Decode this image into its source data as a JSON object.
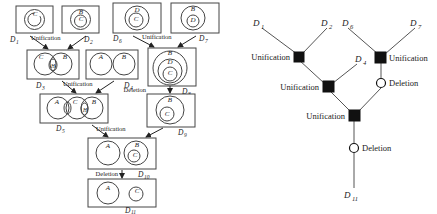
{
  "figure": {
    "left_panel": {
      "name": "venn-derivation-panel",
      "diagrams": [
        {
          "id": "D1",
          "label": "D",
          "sub": "1",
          "sets": [
            "C"
          ]
        },
        {
          "id": "D2",
          "label": "D",
          "sub": "2",
          "sets": [
            "B",
            "C"
          ]
        },
        {
          "id": "D3",
          "label": "D",
          "sub": "3",
          "sets": [
            "C",
            "B",
            "H"
          ]
        },
        {
          "id": "D4",
          "label": "D",
          "sub": "4",
          "sets": [
            "A",
            "B"
          ]
        },
        {
          "id": "D5",
          "label": "D",
          "sub": "5",
          "sets": [
            "A",
            "C",
            "B",
            "H"
          ]
        },
        {
          "id": "D6",
          "label": "D",
          "sub": "6",
          "sets": [
            "D",
            "C"
          ]
        },
        {
          "id": "D7",
          "label": "D",
          "sub": "7",
          "sets": [
            "B",
            "D"
          ]
        },
        {
          "id": "D8",
          "label": "D",
          "sub": "8",
          "sets": [
            "B",
            "D",
            "C"
          ]
        },
        {
          "id": "D9",
          "label": "D",
          "sub": "9",
          "sets": [
            "B",
            "C"
          ]
        },
        {
          "id": "D10",
          "label": "D",
          "sub": "10",
          "sets": [
            "A",
            "B",
            "C"
          ]
        },
        {
          "id": "D11",
          "label": "D",
          "sub": "11",
          "sets": [
            "A",
            "C"
          ]
        }
      ],
      "operations": [
        {
          "id": "op-unification-1",
          "label": "Unification"
        },
        {
          "id": "op-unification-2",
          "label": "Unification"
        },
        {
          "id": "op-unification-3",
          "label": "Unification"
        },
        {
          "id": "op-unification-4",
          "label": "Unification"
        },
        {
          "id": "op-deletion-1",
          "label": "Deletion"
        },
        {
          "id": "op-deletion-2",
          "label": "Deletion"
        }
      ]
    },
    "right_panel": {
      "name": "proof-tree-panel",
      "leaves": [
        {
          "id": "tree-D1",
          "label": "D",
          "sub": "1"
        },
        {
          "id": "tree-D2",
          "label": "D",
          "sub": "2"
        },
        {
          "id": "tree-D6",
          "label": "D",
          "sub": "6"
        },
        {
          "id": "tree-D7",
          "label": "D",
          "sub": "7"
        },
        {
          "id": "tree-D4",
          "label": "D",
          "sub": "4"
        },
        {
          "id": "tree-D11",
          "label": "D",
          "sub": "11"
        }
      ],
      "nodes": [
        {
          "id": "node-unification-left-top",
          "label": "Unification",
          "shape": "square"
        },
        {
          "id": "node-unification-right-top",
          "label": "Unification",
          "shape": "square"
        },
        {
          "id": "node-unification-left-mid",
          "label": "Unification",
          "shape": "square"
        },
        {
          "id": "node-deletion-right",
          "label": "Deletion",
          "shape": "circle"
        },
        {
          "id": "node-unification-root",
          "label": "Unification",
          "shape": "square"
        },
        {
          "id": "node-deletion-root",
          "label": "Deletion",
          "shape": "circle"
        }
      ]
    },
    "colors": {
      "stroke": "#444444",
      "node_fill": "#111111",
      "background": "#ffffff"
    }
  }
}
